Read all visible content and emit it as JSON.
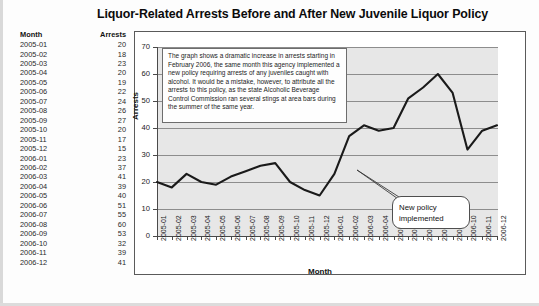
{
  "figure": {
    "title": "Liquor-Related Arrests Before and After New Juvenile Liquor Policy"
  },
  "table": {
    "headers": {
      "month": "Month",
      "arrests": "Arrests"
    },
    "rows": [
      {
        "month": "2005-01",
        "arrests": "20"
      },
      {
        "month": "2005-02",
        "arrests": "18"
      },
      {
        "month": "2005-03",
        "arrests": "23"
      },
      {
        "month": "2005-04",
        "arrests": "20"
      },
      {
        "month": "2005-05",
        "arrests": "19"
      },
      {
        "month": "2005-06",
        "arrests": "22"
      },
      {
        "month": "2005-07",
        "arrests": "24"
      },
      {
        "month": "2005-08",
        "arrests": "26"
      },
      {
        "month": "2005-09",
        "arrests": "27"
      },
      {
        "month": "2005-10",
        "arrests": "20"
      },
      {
        "month": "2005-11",
        "arrests": "17"
      },
      {
        "month": "2005-12",
        "arrests": "15"
      },
      {
        "month": "2006-01",
        "arrests": "23"
      },
      {
        "month": "2006-02",
        "arrests": "37"
      },
      {
        "month": "2006-03",
        "arrests": "41"
      },
      {
        "month": "2006-04",
        "arrests": "39"
      },
      {
        "month": "2006-05",
        "arrests": "40"
      },
      {
        "month": "2006-06",
        "arrests": "51"
      },
      {
        "month": "2006-07",
        "arrests": "55"
      },
      {
        "month": "2006-08",
        "arrests": "60"
      },
      {
        "month": "2006-09",
        "arrests": "53"
      },
      {
        "month": "2006-10",
        "arrests": "32"
      },
      {
        "month": "2006-11",
        "arrests": "39"
      },
      {
        "month": "2006-12",
        "arrests": "41"
      }
    ]
  },
  "annotation": {
    "text": "The graph shows a dramatic increase in arrests starting in February 2006, the same month this agency implemented a new policy requiring arrests of any juveniles caught with alcohol. It would be a mistake, however, to attribute all the arrests to this policy, as the state Alcoholic Beverage Control Commission ran several stings at area bars during the summer of the same year."
  },
  "callout": {
    "line1": "New policy",
    "line2": "implemented",
    "target_month": "2006-01"
  },
  "colors": {
    "plot_background": "#e7e7e7",
    "gridline": "#8d8d8d",
    "series_line": "#1a1a1a",
    "axis": "#4a4a4a",
    "frame": "#5a5a5a"
  },
  "chart_data": {
    "type": "line",
    "title": "Liquor-Related Arrests Before and After New Juvenile Liquor Policy",
    "xlabel": "Month",
    "ylabel": "Arrests",
    "ylim": [
      0,
      70
    ],
    "yticks": [
      0,
      10,
      20,
      30,
      40,
      50,
      60,
      70
    ],
    "grid": true,
    "legend": "none",
    "categories": [
      "2005-01",
      "2005-02",
      "2005-03",
      "2005-04",
      "2005-05",
      "2005-06",
      "2005-07",
      "2005-08",
      "2005-09",
      "2005-10",
      "2005-11",
      "2005-12",
      "2006-01",
      "2006-02",
      "2006-03",
      "2006-04",
      "2006-05",
      "2006-06",
      "2006-07",
      "2006-08",
      "2006-09",
      "2006-10",
      "2006-11",
      "2006-12"
    ],
    "values": [
      20,
      18,
      23,
      20,
      19,
      22,
      24,
      26,
      27,
      20,
      17,
      15,
      23,
      37,
      41,
      39,
      40,
      51,
      55,
      60,
      53,
      32,
      39,
      41
    ],
    "series": [
      {
        "name": "Arrests",
        "values": [
          20,
          18,
          23,
          20,
          19,
          22,
          24,
          26,
          27,
          20,
          17,
          15,
          23,
          37,
          41,
          39,
          40,
          51,
          55,
          60,
          53,
          32,
          39,
          41
        ]
      }
    ],
    "annotations": [
      {
        "text": "New policy implemented",
        "points_to": "2006-01",
        "type": "callout"
      },
      {
        "text": "The graph shows a dramatic increase in arrests starting in February 2006, the same month this agency implemented a new policy requiring arrests of any juveniles caught with alcohol. It would be a mistake, however, to attribute all the arrests to this policy, as the state Alcoholic Beverage Control Commission ran several stings at area bars during the summer of the same year.",
        "type": "textbox"
      }
    ]
  }
}
